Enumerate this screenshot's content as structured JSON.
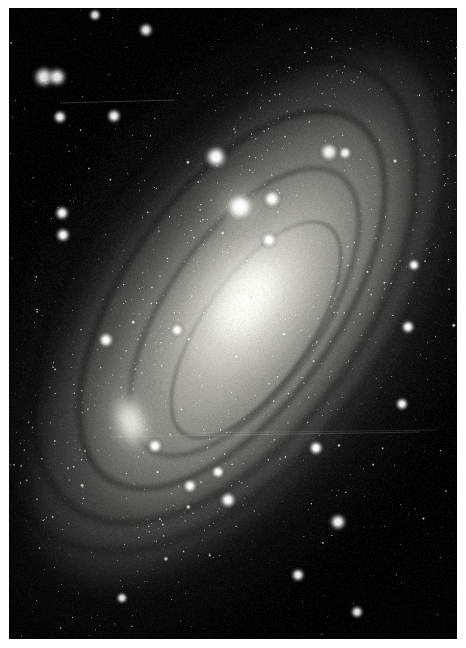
{
  "image": {
    "subject_name": "Andromeda Galaxy",
    "catalog_designation": "M31",
    "alternate_designation": "NGC 224",
    "image_type": "astrophotograph",
    "rendering": "grayscale",
    "width_px": 466,
    "height_px": 648,
    "orientation": "portrait"
  },
  "plate": {
    "left": 9,
    "top": 8,
    "width": 448,
    "height": 631,
    "background_color": "#000000",
    "margin_color": "#ffffff",
    "border_color": "#0a0a0a"
  },
  "objects": [
    {
      "name": "M31 core",
      "label": "galactic-nucleus",
      "cx": 248,
      "cy": 300,
      "major_px": 96,
      "minor_px": 52,
      "position_angle_deg": -55,
      "brightness": "saturated-white",
      "color": "#fffdf8"
    },
    {
      "name": "M31 disk",
      "label": "spiral-disk",
      "cx": 243,
      "cy": 318,
      "major_px": 620,
      "minor_px": 250,
      "position_angle_deg": -55,
      "brightness": "faint-extended",
      "color": "#b9b6ae"
    },
    {
      "name": "M32",
      "label": "companion-galaxy-m32",
      "cx": 240,
      "cy": 207,
      "major_px": 26,
      "minor_px": 22,
      "position_angle_deg": 0,
      "brightness": "bright-compact",
      "color": "#f6f4ef"
    },
    {
      "name": "M110",
      "label": "companion-galaxy-m110",
      "cx": 131,
      "cy": 422,
      "major_px": 34,
      "minor_px": 54,
      "position_angle_deg": -18,
      "brightness": "moderate-diffuse",
      "color": "#eceae3"
    }
  ],
  "dust_lanes": [
    {
      "cx": 232,
      "cy": 300,
      "w": 430,
      "h": 210,
      "border": 5,
      "opacity": 0.46,
      "blur": 2.4,
      "rot": -55
    },
    {
      "cx": 244,
      "cy": 312,
      "w": 330,
      "h": 150,
      "border": 4,
      "opacity": 0.4,
      "blur": 2.0,
      "rot": -55
    },
    {
      "cx": 225,
      "cy": 292,
      "w": 520,
      "h": 282,
      "border": 6,
      "opacity": 0.42,
      "blur": 3.0,
      "rot": -55
    },
    {
      "cx": 256,
      "cy": 330,
      "w": 250,
      "h": 104,
      "border": 3,
      "opacity": 0.34,
      "blur": 1.6,
      "rot": -55
    },
    {
      "cx": 218,
      "cy": 282,
      "w": 600,
      "h": 350,
      "border": 7,
      "opacity": 0.34,
      "blur": 3.6,
      "rot": -55
    }
  ],
  "star_field": {
    "description": "dense foreground Milky Way stars across the whole frame",
    "approx_star_count": 2600,
    "brightest_stars": [
      {
        "x": 44,
        "y": 77,
        "r": 5.4
      },
      {
        "x": 57,
        "y": 77,
        "r": 4.8
      },
      {
        "x": 216,
        "y": 157,
        "r": 5.6
      },
      {
        "x": 240,
        "y": 207,
        "r": 6.2
      },
      {
        "x": 329,
        "y": 152,
        "r": 4.6
      },
      {
        "x": 345,
        "y": 153,
        "r": 3.2
      },
      {
        "x": 269,
        "y": 240,
        "r": 3.8
      },
      {
        "x": 272,
        "y": 199,
        "r": 4.4
      },
      {
        "x": 114,
        "y": 116,
        "r": 3.6
      },
      {
        "x": 60,
        "y": 117,
        "r": 3.4
      },
      {
        "x": 62,
        "y": 213,
        "r": 3.6
      },
      {
        "x": 63,
        "y": 235,
        "r": 3.6
      },
      {
        "x": 106,
        "y": 340,
        "r": 3.8
      },
      {
        "x": 177,
        "y": 330,
        "r": 3.2
      },
      {
        "x": 155,
        "y": 446,
        "r": 3.6
      },
      {
        "x": 228,
        "y": 500,
        "r": 4.0
      },
      {
        "x": 190,
        "y": 486,
        "r": 3.4
      },
      {
        "x": 218,
        "y": 472,
        "r": 3.2
      },
      {
        "x": 316,
        "y": 448,
        "r": 3.6
      },
      {
        "x": 338,
        "y": 522,
        "r": 4.2
      },
      {
        "x": 298,
        "y": 575,
        "r": 3.4
      },
      {
        "x": 408,
        "y": 327,
        "r": 3.4
      },
      {
        "x": 414,
        "y": 265,
        "r": 3.0
      },
      {
        "x": 402,
        "y": 404,
        "r": 3.2
      },
      {
        "x": 146,
        "y": 30,
        "r": 3.6
      },
      {
        "x": 95,
        "y": 15,
        "r": 3.0
      },
      {
        "x": 357,
        "y": 612,
        "r": 3.2
      },
      {
        "x": 122,
        "y": 598,
        "r": 2.8
      }
    ]
  },
  "scratches": [
    {
      "x1": 60,
      "y1": 103,
      "x2": 175,
      "y2": 100,
      "opacity": 0.3
    },
    {
      "x1": 110,
      "y1": 437,
      "x2": 420,
      "y2": 432,
      "opacity": 0.26
    },
    {
      "x1": 196,
      "y1": 433,
      "x2": 438,
      "y2": 430,
      "opacity": 0.18
    }
  ],
  "accent_colors": {
    "sky": "#030303",
    "star": "#ffffff",
    "halo": "#9e9b93",
    "core": "#ffffff",
    "margin": "#ffffff"
  }
}
